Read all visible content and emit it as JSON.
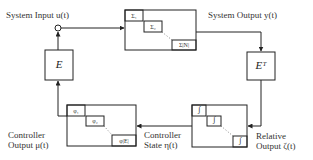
{
  "labels": {
    "system_input": "System Input u(t)",
    "system_output": "System Output y(t)",
    "controller_output_line1": "Controller",
    "controller_output_line2": "Output μ(t)",
    "controller_state_line1": "Controller",
    "controller_state_line2": "State η(t)",
    "relative_output_line1": "Relative",
    "relative_output_line2": "Output ζ(t)"
  },
  "blocks": {
    "input_map": "E",
    "output_map": "Eᵀ",
    "system": {
      "subsystems": [
        "Σ₁",
        "Σ₂",
        "Σ|N|"
      ]
    },
    "controller": {
      "subsystems": [
        "φ₁",
        "φ₂",
        "φ|E|"
      ]
    },
    "integrator": {
      "subsystems": [
        "∫",
        "∫",
        "∫"
      ]
    }
  }
}
